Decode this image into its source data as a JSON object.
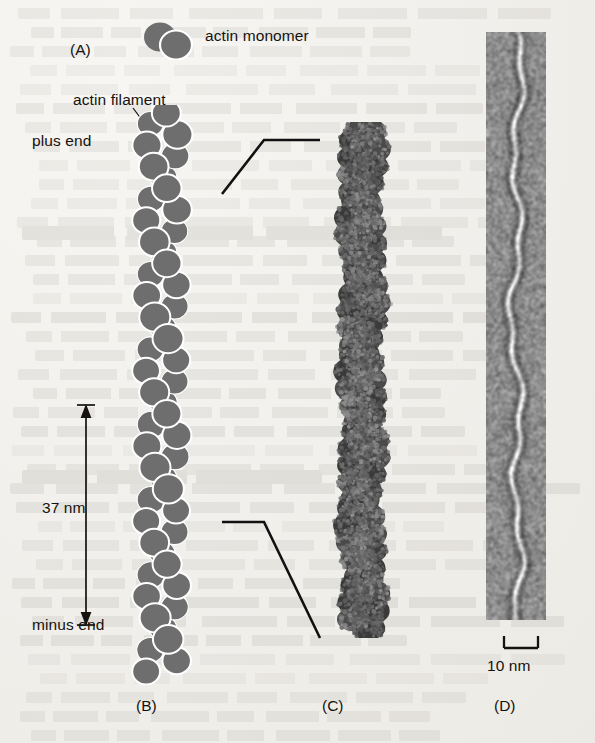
{
  "figure": {
    "caption_labels": {
      "a": "(A)",
      "b": "(B)",
      "c": "(C)",
      "d": "(D)"
    },
    "annotations": {
      "actin_monomer": "actin monomer",
      "actin_filament": "actin filament",
      "plus_end": "plus end",
      "minus_end": "minus end"
    },
    "scale_bars": {
      "filament_repeat": "37 nm",
      "micrograph": "10 nm"
    },
    "colors": {
      "page_background": "#f2f1ee",
      "monomer_fill": "#6e6e6e",
      "monomer_outline": "#ffffff",
      "ink": "#15120f",
      "connector_line": "#111111",
      "model_dark": "#3a3a3a",
      "micrograph_mid": "#8d8d8d",
      "micrograph_bright": "#f2f2f2"
    },
    "panels": [
      {
        "id": "A",
        "name": "actin monomer key",
        "type": "schematic-icon"
      },
      {
        "id": "B",
        "name": "actin filament model",
        "type": "schematic-diagram"
      },
      {
        "id": "C",
        "name": "space-filling molecular model",
        "type": "rendered-structure"
      },
      {
        "id": "D",
        "name": "electron micrograph",
        "type": "micrograph"
      }
    ]
  },
  "chart_data": {
    "type": "diagram",
    "panels": {
      "A": {
        "label": "(A)",
        "content": "actin monomer",
        "element_count": 2
      },
      "B": {
        "label": "(B)",
        "content": "actin filament schematic: two-stranded right-handed helix of globular subunits",
        "polarity": {
          "top": "plus end",
          "bottom": "minus end"
        },
        "helical_repeat_nm": 37,
        "subunit_count_approx": 54,
        "strand_count": 2,
        "crossover_spacing_nm": 37
      },
      "C": {
        "label": "(C)",
        "content": "space-filling atomic model of actin filament"
      },
      "D": {
        "label": "(D)",
        "content": "electron micrograph of negatively stained actin filament",
        "scale_bar_nm": 10
      }
    }
  }
}
